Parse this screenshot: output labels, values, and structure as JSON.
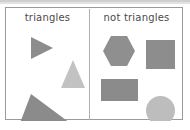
{
  "diagram": {
    "type": "sorting-chart",
    "panels": [
      {
        "id": "triangles",
        "label": "triangles",
        "shapes": [
          {
            "name": "right-pointing-triangle",
            "shape": "triangle",
            "color": "#8d8d8d"
          },
          {
            "name": "upward-triangle",
            "shape": "triangle",
            "color": "#c2c2c2"
          },
          {
            "name": "scalene-right-triangle",
            "shape": "triangle",
            "color": "#8b8b8b"
          }
        ]
      },
      {
        "id": "not-triangles",
        "label": "not triangles",
        "shapes": [
          {
            "name": "hexagon",
            "shape": "hexagon",
            "color": "#8f8f8f"
          },
          {
            "name": "square",
            "shape": "square",
            "color": "#8d8d8d"
          },
          {
            "name": "rectangle",
            "shape": "rectangle",
            "color": "#8b8b8b"
          },
          {
            "name": "circle",
            "shape": "circle",
            "color": "#bdbdbd"
          }
        ]
      }
    ],
    "colors": {
      "border": "#9a9a9a",
      "divider": "#aeaeae",
      "background": "#ffffff",
      "label_text": "#4a4a4a",
      "top_band": "#cfcfcf"
    }
  }
}
